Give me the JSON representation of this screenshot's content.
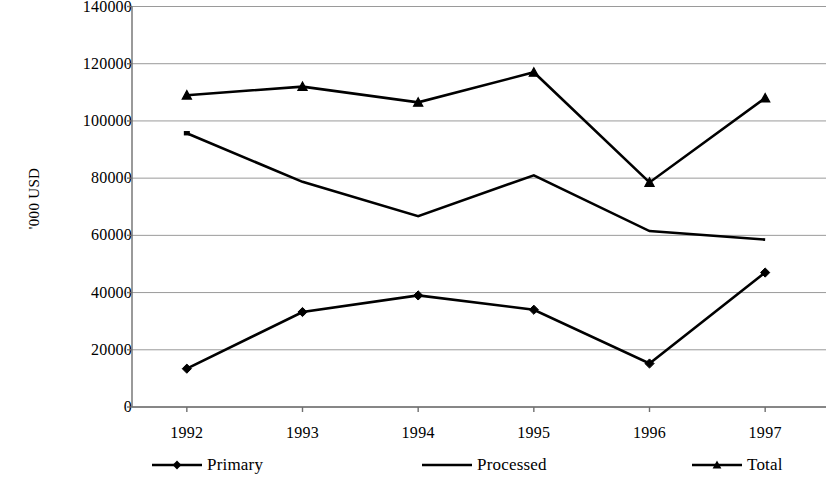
{
  "chart_data": {
    "type": "line",
    "title": "",
    "xlabel": "",
    "ylabel": "'000 USD",
    "categories": [
      "1992",
      "1993",
      "1994",
      "1995",
      "1996",
      "1997"
    ],
    "ylim": [
      0,
      140000
    ],
    "ytick_labels": [
      "140000",
      "120000",
      "100000",
      "80000",
      "60000",
      "40000",
      "20000",
      "0"
    ],
    "ytick_values": [
      140000,
      120000,
      100000,
      80000,
      60000,
      40000,
      20000,
      0
    ],
    "grid": true,
    "legend_position": "bottom",
    "series": [
      {
        "name": "Primary",
        "marker": "diamond",
        "color": "#000000",
        "values": [
          13400,
          33200,
          39000,
          34000,
          15200,
          47000
        ]
      },
      {
        "name": "Processed",
        "marker": "none",
        "color": "#000000",
        "values": [
          95700,
          78700,
          66700,
          81000,
          61500,
          58500
        ]
      },
      {
        "name": "Total",
        "marker": "triangle",
        "color": "#000000",
        "values": [
          109000,
          112000,
          106500,
          117000,
          78500,
          108000
        ]
      }
    ]
  },
  "legend": {
    "items": [
      {
        "label": "Primary",
        "marker": "diamond"
      },
      {
        "label": "Processed",
        "marker": "none"
      },
      {
        "label": "Total",
        "marker": "triangle"
      }
    ]
  },
  "axes": {
    "y_title": "'000 USD"
  }
}
